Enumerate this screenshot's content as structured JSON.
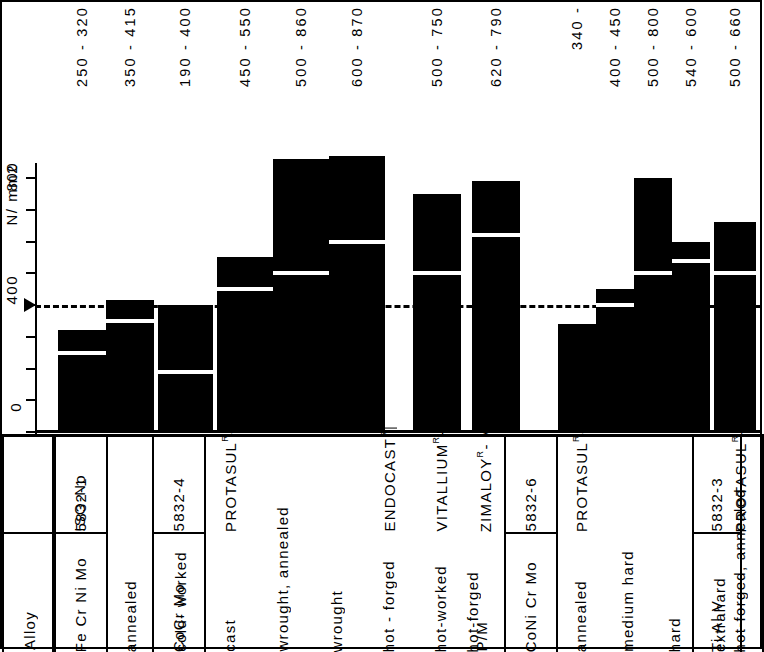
{
  "axis": {
    "unit_label": "N/ mm2",
    "tick_800": "800",
    "tick_400": "400",
    "tick_0": "0"
  },
  "table_headers": {
    "row_iso": "ISO-No",
    "row_alloy": "Alloy"
  },
  "groups": [
    {
      "alloy": "Fe Cr Ni Mo",
      "iso": "5832-1"
    },
    {
      "alloy": "CoCr Mo",
      "iso": "5832-4"
    },
    {
      "alloy": "CoNi Cr Mo",
      "iso": "5832-6"
    },
    {
      "alloy": "Ti Al V",
      "iso": "5832-3"
    }
  ],
  "chart_data": {
    "type": "bar",
    "title": "",
    "ylabel": "N/mm2",
    "ylim": [
      0,
      900
    ],
    "yticks": [
      0,
      400,
      800
    ],
    "reference_line": 400,
    "grid": false,
    "legend": null,
    "note": "Each bar spans its minimum (white marker line) to maximum (bar top). Bars drawn from 0 baseline.",
    "categories": [
      "annealed",
      "cold-worked",
      "cast",
      "wrought, annealed",
      "wrought",
      "hot-forged",
      "hot-worked",
      "hot-forged",
      "P/M",
      "annealed",
      "medium hard",
      "hard",
      "extrahard",
      "hot-forged, annealed"
    ],
    "min_values": [
      250,
      350,
      190,
      450,
      500,
      600,
      null,
      500,
      620,
      340,
      400,
      500,
      540,
      500
    ],
    "max_values": [
      320,
      415,
      400,
      550,
      860,
      870,
      null,
      750,
      790,
      null,
      450,
      800,
      600,
      660
    ],
    "range_labels": [
      "250 - 320",
      "350 - 415",
      "190 - 400",
      "450 - 550",
      "500 - 860",
      "600 - 870",
      "",
      "500 - 750",
      "620 - 790",
      "340 -",
      "400 - 450",
      "500 - 800",
      "540 - 600",
      "500 - 660"
    ]
  },
  "columns": [
    {
      "label": "annealed",
      "brand": "",
      "range": "250 - 320",
      "min": 250,
      "max": 320
    },
    {
      "label": "cold- worked",
      "brand": "",
      "range": "350 - 415",
      "min": 350,
      "max": 415
    },
    {
      "label": "cast",
      "brand": "PROTASUL - 21WF",
      "range": "190 - 400",
      "min": 190,
      "max": 400
    },
    {
      "label": "wrought, annealed",
      "brand": "",
      "range": "450 - 550",
      "min": 450,
      "max": 550
    },
    {
      "label": "wrought",
      "brand": "",
      "range": "500 - 860",
      "min": 500,
      "max": 860
    },
    {
      "label": "hot - forged",
      "brand": "ENDOCAST",
      "range": "600 - 870",
      "min": 600,
      "max": 870
    },
    {
      "label": "hot-worked",
      "brand": "VITALLIUM - FHS",
      "range": "",
      "min": null,
      "max": null
    },
    {
      "label": "hot-forged",
      "brand": "ZIMALOY - Micro Grain",
      "range": "500 - 750",
      "min": 500,
      "max": 750
    },
    {
      "label": "P/M",
      "brand": "",
      "range": "620 - 790",
      "min": 620,
      "max": 790
    },
    {
      "label": "annealed",
      "brand": "PROTASUL - 10",
      "range": "340 -",
      "min": 340,
      "max": null
    },
    {
      "label": "medium  hard",
      "brand": "",
      "range": "400 - 450",
      "min": 400,
      "max": 450
    },
    {
      "label": "hard",
      "brand": "",
      "range": "500 - 800",
      "min": 500,
      "max": 800
    },
    {
      "label": "extrahard",
      "brand": "",
      "range": "540 - 600",
      "min": 540,
      "max": 600
    },
    {
      "label": "hot-forged, annealed",
      "brand": "PROTASUL -64WF",
      "range": "500 - 660",
      "min": 500,
      "max": 660
    }
  ],
  "brand_labels": {
    "protasul21": "PROTASUL",
    "protasul21_suffix": "- 21WF",
    "endocast": "ENDOCAST",
    "vitallium": "VITALLIUM",
    "vitallium_suffix": "- FHS",
    "zimaloy": "ZIMALOY",
    "zimaloy_suffix": "- Micro Grain",
    "protasul10": "PROTASUL",
    "protasul10_suffix": "- 10",
    "protasul64": "PROTASUL",
    "protasul64_suffix": "-64WF",
    "registered_mark": "R"
  },
  "colors": {
    "bar": "#000000",
    "background": "#ffffff",
    "marker_line": "#ffffff",
    "axis": "#000000"
  }
}
